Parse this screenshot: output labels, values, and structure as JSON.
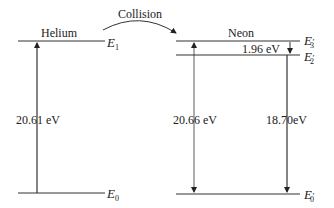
{
  "diagram": {
    "collision_label": "Collision",
    "helium": {
      "label": "Helium",
      "levels": [
        {
          "name": "E",
          "subscript": "1",
          "prime": ""
        },
        {
          "name": "E",
          "subscript": "0",
          "prime": ""
        }
      ],
      "transition_energy": "20.61 eV"
    },
    "neon": {
      "label": "Neon",
      "levels": [
        {
          "name": "E",
          "subscript": "3",
          "prime": "′"
        },
        {
          "name": "E",
          "subscript": "2",
          "prime": "′"
        },
        {
          "name": "E",
          "subscript": "0",
          "prime": "′"
        }
      ],
      "excitation_energy": "20.66 eV",
      "gap_energy": "1.96 eV",
      "emission_energy": "18.70eV"
    }
  }
}
